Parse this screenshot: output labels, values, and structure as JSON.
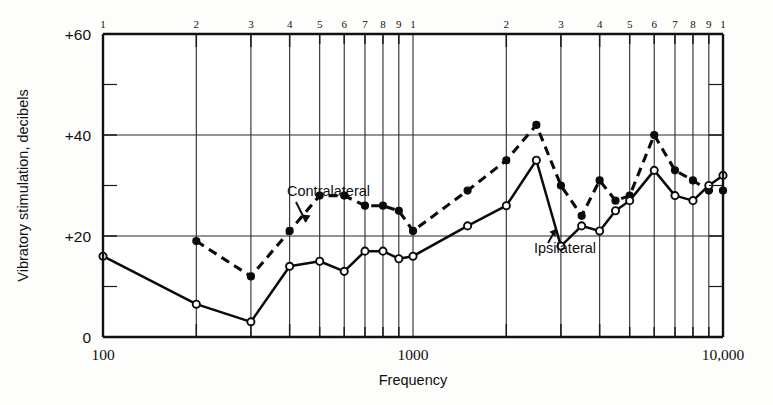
{
  "chart_data": {
    "type": "line",
    "title": "",
    "xlabel": "Frequency",
    "ylabel": "Vibratory stimulation, decibels",
    "xscale": "log",
    "xlim": [
      100,
      10000
    ],
    "ylim": [
      0,
      60
    ],
    "grid": true,
    "legend_position": "inline-annotation",
    "y_ticks_major": [
      0,
      20,
      40,
      60
    ],
    "y_tick_labels": [
      "0",
      "+20",
      "+40",
      "+60"
    ],
    "y_ticks_minor": [
      10,
      30,
      50
    ],
    "x_tick_labels_bottom": [
      "100",
      "1000",
      "10,000"
    ],
    "x_tick_labels_top": [
      "1",
      "2",
      "3",
      "4",
      "5",
      "6",
      "7",
      "8",
      "9",
      "1",
      "2",
      "3",
      "4",
      "5",
      "6",
      "7",
      "8",
      "9",
      "1"
    ],
    "top_axis_tick_values": [
      100,
      200,
      300,
      400,
      500,
      600,
      700,
      800,
      900,
      1000,
      2000,
      3000,
      4000,
      5000,
      6000,
      7000,
      8000,
      9000,
      10000
    ],
    "major_gridline_values": [
      100,
      200,
      300,
      400,
      500,
      600,
      700,
      800,
      900,
      1000,
      2000,
      3000,
      4000,
      5000,
      6000,
      7000,
      8000,
      9000,
      10000
    ],
    "series": [
      {
        "name": "Contralateral",
        "style": "dashed",
        "marker": "filled-circle",
        "x": [
          200,
          300,
          400,
          500,
          600,
          700,
          800,
          900,
          1000,
          1500,
          2000,
          2500,
          3000,
          3500,
          4000,
          4500,
          5000,
          6000,
          7000,
          8000,
          9000,
          10000
        ],
        "values": [
          19,
          12,
          21,
          28,
          28,
          26,
          26,
          25,
          21,
          29,
          35,
          42,
          30,
          24,
          31,
          27,
          28,
          40,
          33,
          31,
          29,
          29
        ]
      },
      {
        "name": "Ipsilateral",
        "style": "solid",
        "marker": "open-circle",
        "x": [
          100,
          200,
          300,
          400,
          500,
          600,
          700,
          800,
          900,
          1000,
          1500,
          2000,
          2500,
          3000,
          3500,
          4000,
          4500,
          5000,
          6000,
          7000,
          8000,
          9000,
          10000
        ],
        "values": [
          16,
          6.5,
          3,
          14,
          15,
          13,
          17,
          17,
          15.5,
          16,
          22,
          26,
          35,
          18,
          22,
          21,
          25,
          27,
          33,
          28,
          27,
          30,
          32
        ]
      }
    ],
    "annotations": [
      {
        "text": "Contralateral",
        "points_to_series": "Contralateral"
      },
      {
        "text": "Ipsilateral",
        "points_to_series": "Ipsilateral"
      }
    ]
  }
}
